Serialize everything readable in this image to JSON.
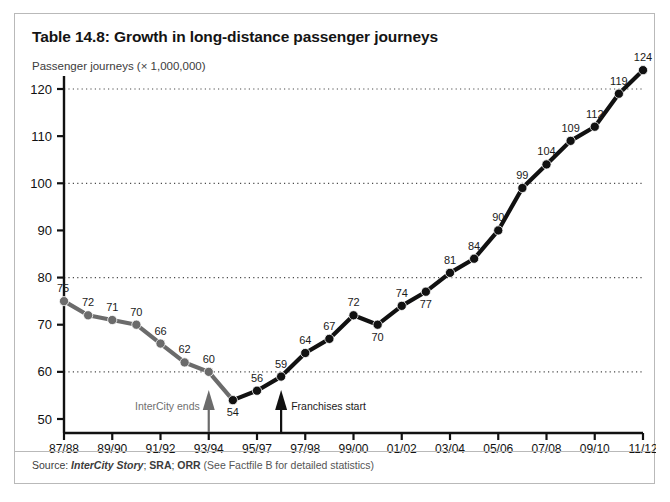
{
  "card": {
    "title": "Table 14.8: Growth in long-distance passenger journeys",
    "source_prefix": "Source: ",
    "source_italic": "InterCity Story",
    "source_sep1": "; ",
    "source_bold1": "SRA",
    "source_sep2": "; ",
    "source_bold2": "ORR",
    "source_paren": " (See Factfile B for detailed statistics)"
  },
  "annotations": {
    "intercity": {
      "label": "InterCity ends",
      "at_category": "93/94"
    },
    "franchises": {
      "label": "Franchises start",
      "at_category": "96/97"
    }
  },
  "chart_data": {
    "type": "line",
    "title": "Table 14.8: Growth in long-distance passenger journeys",
    "ylabel": "Passenger journeys (× 1,000,000)",
    "xlabel": "",
    "ylim": [
      50,
      120
    ],
    "yticks": [
      50,
      60,
      70,
      80,
      90,
      100,
      110,
      120
    ],
    "gridlines": [
      60,
      80,
      100,
      120
    ],
    "grid": true,
    "legend": false,
    "xtick_labels": [
      "87/88",
      "89/90",
      "91/92",
      "93/94",
      "95/97",
      "97/98",
      "99/00",
      "01/02",
      "03/04",
      "05/06",
      "07/08",
      "09/10",
      "11/12"
    ],
    "x": [
      "87/88",
      "88/89",
      "89/90",
      "90/91",
      "91/92",
      "92/93",
      "93/94",
      "94/95",
      "95/96",
      "96/97",
      "97/98",
      "98/99",
      "99/00",
      "00/01",
      "01/02",
      "02/03",
      "03/04",
      "04/05",
      "05/06",
      "06/07",
      "07/08",
      "08/09",
      "09/10",
      "10/11",
      "11/12"
    ],
    "values": [
      75,
      72,
      71,
      70,
      66,
      62,
      60,
      54,
      56,
      59,
      64,
      67,
      72,
      70,
      74,
      77,
      81,
      84,
      90,
      99,
      104,
      109,
      112,
      119,
      124
    ],
    "point_labels": [
      "75",
      "72",
      "71",
      "70",
      "66",
      "62",
      "60",
      "54",
      "56",
      "59",
      "64",
      "67",
      "72",
      "70",
      "74",
      "77",
      "81",
      "84",
      "90",
      "99",
      "104",
      "109",
      "112",
      "119",
      "124"
    ],
    "segment_colors": {
      "early": "#6b6b6b",
      "late": "#111111"
    },
    "segment_split_index": 7
  }
}
